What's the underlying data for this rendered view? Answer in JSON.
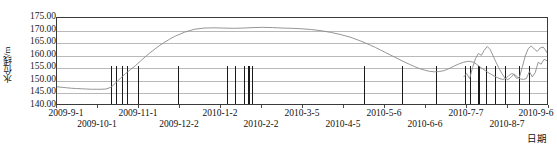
{
  "chart_data": {
    "type": "line",
    "title": "",
    "xlabel": "日期",
    "ylabel": "水位线/m",
    "ylim": [
      140.0,
      175.0
    ],
    "ytick_step": 5.0,
    "grid": true,
    "legend": "none",
    "yticks": [
      "175.00",
      "170.00",
      "165.00",
      "160.00",
      "155.00",
      "150.00",
      "145.00",
      "140.00"
    ],
    "ytick_values": [
      175.0,
      170.0,
      165.0,
      160.0,
      155.0,
      150.0,
      145.0,
      140.0
    ],
    "xticks": [
      "2009-9-1",
      "2009-10-1",
      "2009-11-1",
      "2009-12-2",
      "2010-1-2",
      "2010-2-2",
      "2010-3-5",
      "2010-4-5",
      "2010-5-6",
      "2010-6-6",
      "2010-7-7",
      "2010-8-7",
      "2010-9-6"
    ],
    "xtick_positions": [
      0.0,
      8.33,
      16.67,
      25.0,
      33.33,
      41.67,
      50.0,
      58.33,
      66.67,
      75.0,
      83.33,
      91.67,
      100.0
    ],
    "series": [
      {
        "name": "水位线",
        "color": "#8a8a8a",
        "x": [
          0.0,
          1.0,
          2.0,
          3.0,
          4.0,
          5.0,
          6.0,
          7.0,
          8.0,
          9.0,
          10.0,
          11.0,
          12.0,
          13.0,
          14.0,
          15.0,
          16.0,
          17.0,
          18.0,
          19.0,
          20.0,
          21.0,
          22.0,
          23.0,
          24.0,
          26.0,
          28.0,
          30.0,
          32.0,
          34.0,
          36.0,
          38.0,
          40.0,
          42.0,
          44.0,
          46.0,
          48.0,
          50.0,
          52.0,
          54.0,
          56.0,
          58.0,
          60.0,
          62.0,
          63.0,
          64.0,
          65.0,
          66.0,
          67.0,
          68.0,
          69.0,
          70.0,
          71.0,
          72.0,
          73.0,
          74.0,
          75.0,
          76.0,
          77.0,
          78.0,
          79.0,
          80.0,
          81.0,
          82.0,
          83.0,
          84.0,
          85.0,
          85.6,
          86.2,
          86.8,
          87.4,
          88.0,
          88.6,
          89.2,
          89.8,
          90.4,
          91.0,
          91.6,
          92.2,
          92.8,
          93.4,
          94.0,
          94.6,
          95.2,
          95.8,
          96.4,
          97.0,
          97.6,
          98.2,
          98.8,
          99.4,
          100.0
        ],
        "y": [
          147.0,
          146.8,
          146.6,
          146.4,
          146.3,
          146.2,
          146.1,
          146.0,
          146.0,
          146.0,
          146.1,
          146.8,
          148.6,
          150.6,
          152.4,
          154.0,
          155.6,
          157.4,
          159.2,
          160.9,
          162.4,
          163.9,
          165.2,
          166.4,
          167.5,
          169.2,
          170.4,
          170.9,
          171.0,
          170.9,
          170.8,
          170.9,
          171.1,
          171.2,
          171.1,
          170.9,
          170.8,
          170.6,
          170.3,
          169.8,
          169.1,
          168.2,
          167.1,
          165.6,
          164.8,
          163.9,
          163.0,
          162.0,
          161.0,
          160.0,
          159.0,
          158.0,
          157.0,
          156.1,
          155.2,
          154.4,
          153.8,
          153.3,
          153.1,
          153.2,
          153.6,
          154.4,
          155.4,
          156.3,
          157.0,
          157.4,
          157.0,
          156.2,
          155.3,
          154.4,
          153.6,
          152.8,
          152.1,
          151.4,
          150.8,
          150.3,
          150.0,
          150.4,
          151.6,
          152.4,
          152.0,
          150.9,
          150.2,
          150.0,
          150.4,
          153.2,
          151.0,
          152.8,
          157.0,
          156.2,
          158.2,
          157.6
        ]
      },
      {
        "name": "水位线-续",
        "color": "#8a8a8a",
        "x": [
          83.0,
          83.6,
          84.2,
          84.8,
          85.4,
          86.0,
          86.6,
          87.2,
          87.8,
          88.4,
          89.0,
          89.6,
          90.2,
          90.8,
          91.4,
          92.0,
          92.6,
          93.2,
          93.8,
          94.4,
          95.0,
          95.6,
          96.2,
          96.8,
          97.4,
          98.0,
          98.6,
          99.2,
          99.8,
          100.0
        ],
        "y": [
          151.0,
          152.4,
          150.3,
          154.8,
          158.4,
          160.6,
          159.8,
          161.9,
          163.4,
          162.2,
          159.6,
          157.0,
          154.6,
          152.4,
          150.6,
          149.9,
          150.8,
          152.0,
          150.4,
          151.0,
          155.4,
          159.8,
          162.6,
          163.6,
          162.4,
          161.4,
          162.8,
          163.2,
          161.6,
          160.8
        ]
      }
    ],
    "event_bars": {
      "name": "事件竖线",
      "color": "#1a1a1a",
      "baseline": 140.0,
      "top": 155.0,
      "positions": [
        11.0,
        12.0,
        13.2,
        14.2,
        16.4,
        24.6,
        34.6,
        36.2,
        38.0,
        38.8,
        39.6,
        62.4,
        70.2,
        77.0,
        83.0,
        83.9,
        85.6,
        87.2,
        89.0,
        91.0,
        94.0,
        96.0
      ],
      "thick_positions": [
        38.8,
        85.6
      ]
    }
  }
}
